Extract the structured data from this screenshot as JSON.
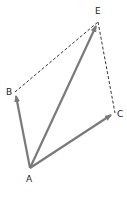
{
  "diagram": {
    "type": "vector-parallelogram",
    "points": {
      "A": {
        "label": "A",
        "x": 30,
        "y": 168
      },
      "B": {
        "label": "B",
        "x": 15,
        "y": 92
      },
      "C": {
        "label": "C",
        "x": 115,
        "y": 113
      },
      "E": {
        "label": "E",
        "x": 98,
        "y": 22
      }
    },
    "vectors": [
      {
        "from": "A",
        "to": "B",
        "style": "solid-arrow"
      },
      {
        "from": "A",
        "to": "E",
        "style": "solid-arrow"
      },
      {
        "from": "A",
        "to": "C",
        "style": "solid-arrow"
      }
    ],
    "dashed_lines": [
      {
        "from": "B",
        "to": "E"
      },
      {
        "from": "E",
        "to": "C"
      }
    ],
    "colors": {
      "arrow": "#7a7a7a",
      "dashed": "#333333",
      "label": "#222222",
      "background": "#ffffff"
    }
  }
}
